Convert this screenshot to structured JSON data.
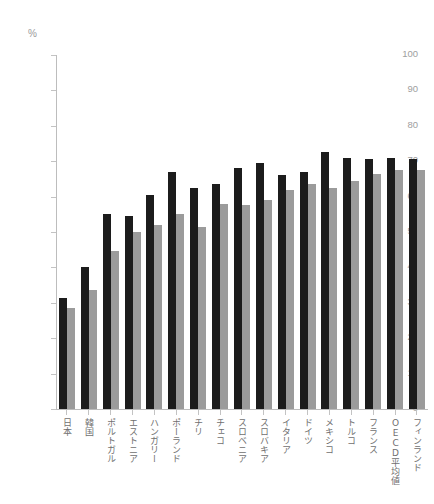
{
  "chart_data": {
    "type": "bar",
    "title": "",
    "subtitle": "",
    "xlabel": "",
    "ylabel": "",
    "unit_label": "%",
    "ylim": [
      0,
      100
    ],
    "yticks": [
      0,
      10,
      20,
      30,
      40,
      50,
      60,
      70,
      80,
      90,
      100
    ],
    "grid": false,
    "legend": "none",
    "categories": [
      "日本",
      "韓国",
      "ポルトガル",
      "エストニア",
      "ハンガリー",
      "ポーランド",
      "チリ",
      "チェコ",
      "スロベニア",
      "スロバキア",
      "イタリア",
      "ドイツ",
      "メキシコ",
      "トルコ",
      "フランス",
      "OECD平均値",
      "フィンランド"
    ],
    "series": [
      {
        "name": "series-dark",
        "color": "#1c1c1c",
        "values": [
          31.5,
          40.0,
          55.0,
          54.5,
          60.5,
          67.0,
          62.5,
          63.5,
          68.0,
          69.5,
          66.0,
          67.0,
          72.5,
          71.0,
          70.5,
          71.0,
          0
        ]
      },
      {
        "name": "series-light",
        "color": "#9b9b9b",
        "values": [
          28.5,
          33.5,
          44.5,
          50.0,
          52.0,
          55.0,
          51.5,
          58.0,
          57.5,
          59.0,
          62.0,
          63.5,
          62.5,
          64.5,
          66.5,
          67.5,
          0
        ]
      }
    ],
    "pairs": [
      {
        "category": "日本",
        "dark": 31.5,
        "light": 28.5
      },
      {
        "category": "韓国",
        "dark": 40.0,
        "light": 33.5
      },
      {
        "category": "ポルトガル",
        "dark": 55.0,
        "light": 44.5
      },
      {
        "category": "エストニア",
        "dark": 54.5,
        "light": 50.0
      },
      {
        "category": "ハンガリー",
        "dark": 60.5,
        "light": 52.0
      },
      {
        "category": "ポーランド",
        "dark": 67.0,
        "light": 55.0
      },
      {
        "category": "チリ",
        "dark": 62.5,
        "light": 51.5
      },
      {
        "category": "チェコ",
        "dark": 63.5,
        "light": 58.0
      },
      {
        "category": "スロベニア",
        "dark": 68.0,
        "light": 57.5
      },
      {
        "category": "スロバキア",
        "dark": 69.5,
        "light": 59.0
      },
      {
        "category": "イタリア",
        "dark": 66.0,
        "light": 62.0
      },
      {
        "category": "ドイツ",
        "dark": 67.0,
        "light": 63.5
      },
      {
        "category": "メキシコ",
        "dark": 72.5,
        "light": 62.5
      },
      {
        "category": "トルコ",
        "dark": 71.0,
        "light": 64.5
      },
      {
        "category": "フランス",
        "dark": 70.5,
        "light": 66.5
      },
      {
        "category": "OECD平均値",
        "dark": 71.0,
        "light": 67.5
      },
      {
        "category": "フィンランド",
        "dark": 70.5,
        "light": 67.5
      }
    ]
  },
  "colors": {
    "dark_bar": "#1c1c1c",
    "light_bar": "#9b9b9b",
    "axis": "#bdbdbd",
    "tick_text": "#9e9e9e",
    "label_text": "#6f6f6f",
    "background": "#ffffff"
  }
}
